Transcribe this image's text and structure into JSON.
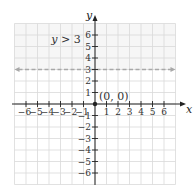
{
  "chart_data": {
    "type": "line",
    "title": "",
    "xlabel": "x",
    "ylabel": "y",
    "xlim": [
      -7,
      7
    ],
    "ylim": [
      -7,
      7
    ],
    "grid": true,
    "x_ticks": [
      -6,
      -5,
      -4,
      -3,
      -2,
      -1,
      1,
      2,
      3,
      4,
      5,
      6
    ],
    "x_tick_labels": [
      "-6",
      "-5",
      "-4",
      "-3",
      "-2",
      "-1",
      "1",
      "2",
      "3",
      "4",
      "5",
      "6"
    ],
    "y_ticks": [
      6,
      5,
      4,
      3,
      2,
      1,
      -1,
      -2,
      -3,
      -4,
      -5,
      -6
    ],
    "y_tick_labels": [
      "6",
      "5",
      "4",
      "3",
      "2",
      "1",
      "-1",
      "-2",
      "-3",
      "-4",
      "-5",
      "-6"
    ],
    "series": [
      {
        "name": "boundary y = 3",
        "style": "dashed",
        "x": [
          -7,
          7
        ],
        "y": [
          3,
          3
        ],
        "arrows": true
      }
    ],
    "shaded_region": {
      "description": "y > 3",
      "y_from": 3,
      "y_to": 7
    },
    "points": [
      {
        "x": 0,
        "y": 0,
        "label": "(0, 0)"
      }
    ],
    "annotations": [
      {
        "text": "y > 3",
        "x": -3.8,
        "y": 5.3
      }
    ]
  },
  "labels": {
    "inequality": "y > 3",
    "origin": "(0, 0)",
    "x_axis": "x",
    "y_axis": "y"
  },
  "colors": {
    "grid": "#d9d9d9",
    "axis": "#222222",
    "boundary": "#a8a8a8",
    "shade": "#f6f6f6"
  }
}
